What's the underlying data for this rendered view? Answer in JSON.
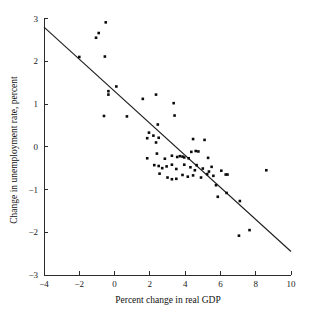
{
  "chart_data": {
    "type": "scatter",
    "title": "",
    "xlabel": "Percent change in real GDP",
    "ylabel": "Change in unemployment rate, percent",
    "xlim": [
      -4,
      10
    ],
    "ylim": [
      -3,
      3
    ],
    "xticks": [
      -4,
      -2,
      0,
      2,
      4,
      6,
      8,
      10
    ],
    "xtick_labels": [
      "−4",
      "−2",
      "0",
      "2",
      "4",
      "6",
      "8",
      "10"
    ],
    "yticks": [
      -3,
      -2,
      -1,
      0,
      1,
      2,
      3
    ],
    "ytick_labels": [
      "−3",
      "−2",
      "−1",
      "0",
      "1",
      "2",
      "3"
    ],
    "grid": false,
    "legend": null,
    "marker": "filled-square",
    "marker_color": "#0b0b0b",
    "fit_line": {
      "label": "regression line",
      "color": "#1c1c1c",
      "x_start": -4,
      "y_start": 2.8,
      "x_end": 10,
      "y_end": -2.45,
      "slope": -0.375,
      "intercept": 1.3
    },
    "points": [
      [
        -0.5,
        2.91
      ],
      [
        -0.9,
        2.66
      ],
      [
        -1.05,
        2.55
      ],
      [
        -2.0,
        2.1
      ],
      [
        -0.55,
        2.11
      ],
      [
        0.1,
        1.41
      ],
      [
        -0.35,
        1.3
      ],
      [
        -0.35,
        1.22
      ],
      [
        -0.6,
        0.72
      ],
      [
        0.7,
        0.71
      ],
      [
        1.6,
        1.12
      ],
      [
        2.35,
        1.22
      ],
      [
        3.35,
        1.02
      ],
      [
        3.4,
        0.73
      ],
      [
        2.45,
        0.52
      ],
      [
        1.95,
        0.33
      ],
      [
        2.2,
        0.26
      ],
      [
        1.85,
        0.2
      ],
      [
        2.5,
        0.21
      ],
      [
        2.35,
        0.1
      ],
      [
        4.45,
        0.18
      ],
      [
        5.1,
        0.16
      ],
      [
        1.85,
        -0.27
      ],
      [
        2.4,
        -0.16
      ],
      [
        2.85,
        -0.28
      ],
      [
        3.25,
        -0.21
      ],
      [
        3.55,
        -0.24
      ],
      [
        3.7,
        -0.22
      ],
      [
        3.85,
        -0.23
      ],
      [
        3.95,
        -0.25
      ],
      [
        4.2,
        -0.27
      ],
      [
        4.35,
        -0.12
      ],
      [
        4.6,
        -0.1
      ],
      [
        4.75,
        -0.11
      ],
      [
        5.3,
        -0.26
      ],
      [
        2.25,
        -0.43
      ],
      [
        2.5,
        -0.45
      ],
      [
        2.7,
        -0.5
      ],
      [
        2.95,
        -0.46
      ],
      [
        3.25,
        -0.42
      ],
      [
        3.5,
        -0.52
      ],
      [
        3.95,
        -0.42
      ],
      [
        4.3,
        -0.48
      ],
      [
        4.55,
        -0.55
      ],
      [
        4.65,
        -0.43
      ],
      [
        5.0,
        -0.51
      ],
      [
        5.35,
        -0.58
      ],
      [
        5.5,
        -0.47
      ],
      [
        2.55,
        -0.63
      ],
      [
        3.0,
        -0.72
      ],
      [
        3.25,
        -0.76
      ],
      [
        3.5,
        -0.75
      ],
      [
        3.85,
        -0.66
      ],
      [
        4.15,
        -0.7
      ],
      [
        4.45,
        -0.67
      ],
      [
        4.9,
        -0.72
      ],
      [
        5.25,
        -0.64
      ],
      [
        5.6,
        -0.68
      ],
      [
        6.05,
        -0.56
      ],
      [
        6.3,
        -0.65
      ],
      [
        6.4,
        -0.65
      ],
      [
        5.75,
        -0.9
      ],
      [
        6.35,
        -1.08
      ],
      [
        5.85,
        -1.17
      ],
      [
        7.1,
        -1.27
      ],
      [
        7.05,
        -2.08
      ],
      [
        7.65,
        -1.95
      ],
      [
        8.6,
        -0.55
      ]
    ]
  }
}
